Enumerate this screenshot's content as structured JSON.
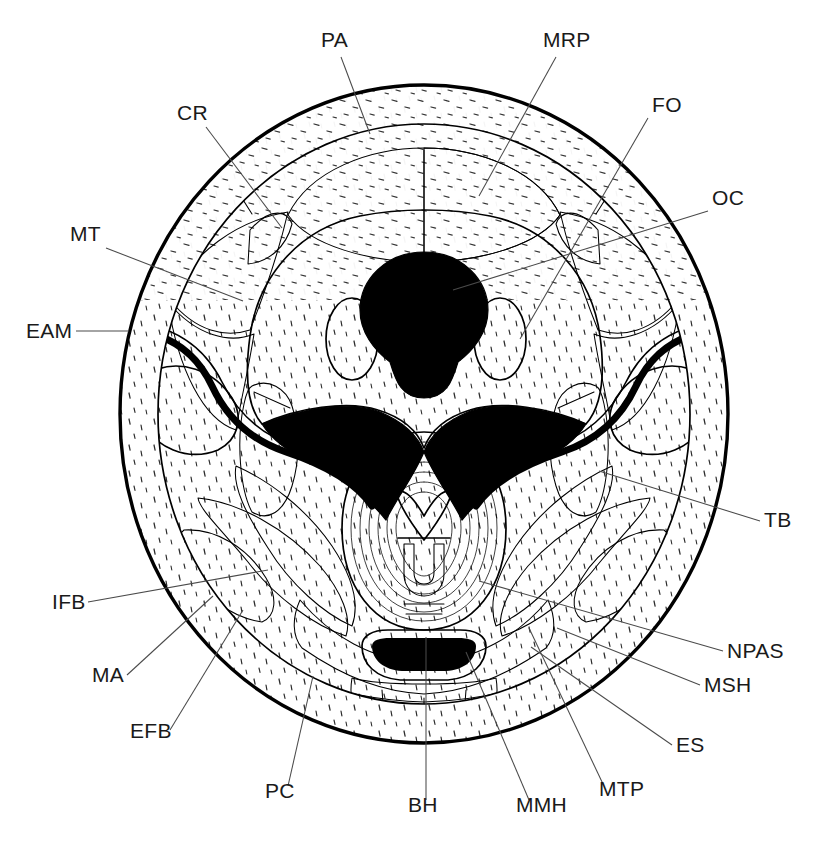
{
  "figure": {
    "view": "axial cross-section",
    "background_color": "#ffffff",
    "ink_color": "#000000",
    "leader_color": "#4a4a4a"
  },
  "labels": [
    {
      "id": "PA",
      "text": "PA",
      "x": 321,
      "y": 47,
      "anchor": "start",
      "leader": [
        [
          341,
          57
        ],
        [
          370,
          134
        ]
      ]
    },
    {
      "id": "MRP",
      "text": "MRP",
      "x": 543,
      "y": 47,
      "anchor": "start",
      "leader": [
        [
          556,
          57
        ],
        [
          479,
          196
        ]
      ]
    },
    {
      "id": "CR",
      "text": "CR",
      "x": 177,
      "y": 120,
      "anchor": "start",
      "leader": [
        [
          206,
          127
        ],
        [
          282,
          228
        ]
      ]
    },
    {
      "id": "FO",
      "text": "FO",
      "x": 652,
      "y": 112,
      "anchor": "start",
      "leader": [
        [
          648,
          118
        ],
        [
          520,
          339
        ]
      ]
    },
    {
      "id": "OC",
      "text": "OC",
      "x": 712,
      "y": 205,
      "anchor": "start",
      "leader": [
        [
          708,
          211
        ],
        [
          453,
          290
        ]
      ]
    },
    {
      "id": "MT",
      "text": "MT",
      "x": 70,
      "y": 241,
      "anchor": "start",
      "leader": [
        [
          106,
          248
        ],
        [
          243,
          301
        ]
      ]
    },
    {
      "id": "EAM",
      "text": "EAM",
      "x": 26,
      "y": 338,
      "anchor": "start",
      "leader": [
        [
          76,
          331
        ],
        [
          129,
          331
        ]
      ]
    },
    {
      "id": "TB",
      "text": "TB",
      "x": 764,
      "y": 527,
      "anchor": "start",
      "leader": [
        [
          760,
          521
        ],
        [
          599,
          471
        ]
      ]
    },
    {
      "id": "IFB",
      "text": "IFB",
      "x": 52,
      "y": 609,
      "anchor": "start",
      "leader": [
        [
          88,
          602
        ],
        [
          268,
          570
        ]
      ]
    },
    {
      "id": "NPAS",
      "text": "NPAS",
      "x": 727,
      "y": 658,
      "anchor": "start",
      "leader": [
        [
          723,
          651
        ],
        [
          479,
          581
        ]
      ]
    },
    {
      "id": "MA",
      "text": "MA",
      "x": 92,
      "y": 682,
      "anchor": "start",
      "leader": [
        [
          127,
          675
        ],
        [
          213,
          596
        ]
      ]
    },
    {
      "id": "MSH",
      "text": "MSH",
      "x": 704,
      "y": 692,
      "anchor": "start",
      "leader": [
        [
          700,
          685
        ],
        [
          557,
          628
        ]
      ]
    },
    {
      "id": "EFB",
      "text": "EFB",
      "x": 130,
      "y": 738,
      "anchor": "start",
      "leader": [
        [
          170,
          730
        ],
        [
          243,
          610
        ]
      ]
    },
    {
      "id": "ES",
      "text": "ES",
      "x": 676,
      "y": 752,
      "anchor": "start",
      "leader": [
        [
          672,
          745
        ],
        [
          531,
          647
        ]
      ]
    },
    {
      "id": "PC",
      "text": "PC",
      "x": 265,
      "y": 798,
      "anchor": "start",
      "leader": [
        [
          288,
          786
        ],
        [
          313,
          676
        ]
      ]
    },
    {
      "id": "MTP",
      "text": "MTP",
      "x": 599,
      "y": 796,
      "anchor": "start",
      "leader": [
        [
          603,
          784
        ],
        [
          529,
          628
        ]
      ]
    },
    {
      "id": "MMH",
      "text": "MMH",
      "x": 516,
      "y": 812,
      "anchor": "start",
      "leader": [
        [
          529,
          800
        ],
        [
          466,
          652
        ]
      ]
    },
    {
      "id": "BH",
      "text": "BH",
      "x": 408,
      "y": 812,
      "anchor": "start",
      "leader": [
        [
          426,
          800
        ],
        [
          426,
          637
        ]
      ]
    }
  ],
  "geometry": {
    "outer_circle": {
      "cx": 424,
      "cy": 414,
      "rx": 304,
      "ry": 329
    },
    "inner_circle": {
      "cx": 424,
      "cy": 414,
      "rx": 266,
      "ry": 290
    },
    "foramen_magnum": {
      "cx": 424,
      "cy": 305,
      "r": 48
    },
    "left_oval": {
      "cx": 352,
      "cy": 339,
      "rx": 26,
      "ry": 40
    },
    "right_oval": {
      "cx": 500,
      "cy": 339,
      "rx": 26,
      "ry": 40
    }
  }
}
